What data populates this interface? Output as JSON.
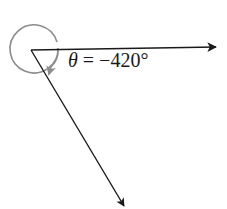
{
  "diagram": {
    "type": "angle-in-standard-position",
    "label": {
      "symbol": "θ",
      "equals": " = ",
      "value": "−420°"
    },
    "angle_degrees": -420,
    "direction": "clockwise",
    "vertex": {
      "x": 31,
      "y": 50
    },
    "initial_side": {
      "x2": 218,
      "y2": 47
    },
    "terminal_side": {
      "x2": 125,
      "y2": 208
    },
    "rotation_arc": {
      "cx": 34,
      "cy": 48,
      "r": 24
    },
    "colors": {
      "ray": "#1a1a1a",
      "arc": "#8c8c8c",
      "background": "#ffffff"
    }
  }
}
